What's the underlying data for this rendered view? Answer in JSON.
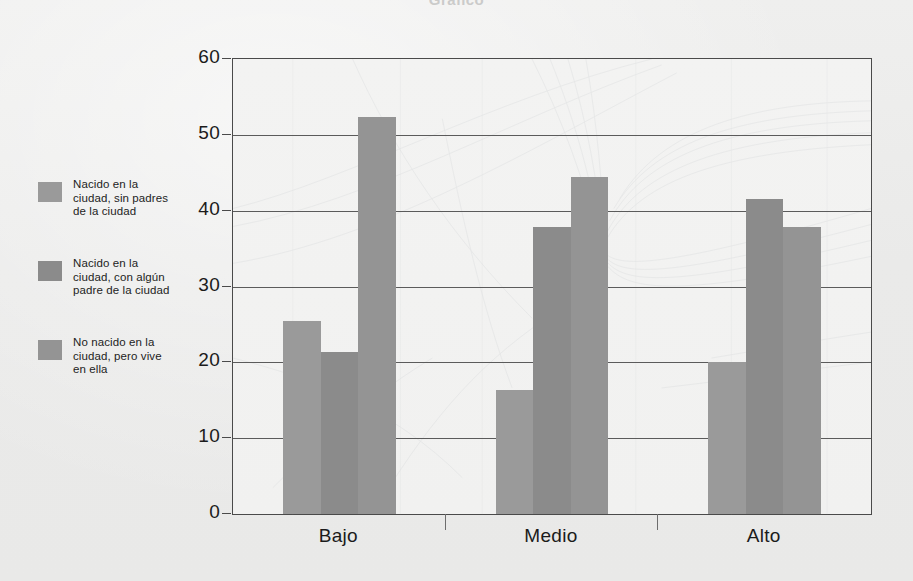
{
  "figure": {
    "background_color": "#ececeb",
    "plot_background_color": "#f2f2f1",
    "frame_color": "#4a4a4a",
    "title_faint": "Gráfico"
  },
  "legend": {
    "items": [
      {
        "label": "Nacido en la\nciudad, sin padres\nde la ciudad",
        "color": "#9a9a9a",
        "swatch_name": "legend-swatch-1"
      },
      {
        "label": "Nacido en la\nciudad, con algún\npadre de la ciudad",
        "color": "#8b8b8b",
        "swatch_name": "legend-swatch-2"
      },
      {
        "label": "No nacido en la\nciudad, pero vive\nen ella",
        "color": "#949494",
        "swatch_name": "legend-swatch-3"
      }
    ]
  },
  "chart_data": {
    "type": "bar",
    "title": "",
    "xlabel": "",
    "ylabel": "",
    "categories": [
      "Bajo",
      "Medio",
      "Alto"
    ],
    "series": [
      {
        "name": "Nacido en la ciudad, sin padres de la ciudad",
        "color": "#9a9a9a",
        "values": [
          25.4,
          16.4,
          20.0
        ]
      },
      {
        "name": "Nacido en la ciudad, con algún padre de la ciudad",
        "color": "#8b8b8b",
        "values": [
          21.3,
          37.8,
          41.6
        ]
      },
      {
        "name": "No nacido en la ciudad, pero vive en ella",
        "color": "#949494",
        "values": [
          52.4,
          44.5,
          37.9
        ]
      }
    ],
    "ylim": [
      0,
      60
    ],
    "yticks": [
      0,
      10,
      20,
      30,
      40,
      50,
      60
    ],
    "ytick_labels": [
      "0",
      "10",
      "20",
      "30",
      "40",
      "50",
      "60"
    ],
    "grid": true,
    "grid_axis": "y",
    "legend_position": "left-outside",
    "bar_group_gap": true,
    "bars_touch_within_group": true
  }
}
